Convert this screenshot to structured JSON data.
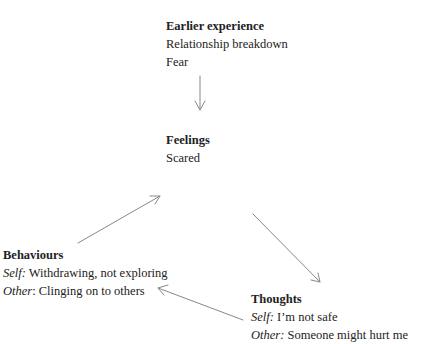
{
  "nodes": {
    "earlier": {
      "title": "Earlier experience",
      "lines": [
        "Relationship breakdown",
        "Fear"
      ]
    },
    "feelings": {
      "title": "Feelings",
      "lines": [
        "Scared"
      ]
    },
    "behaviours": {
      "title": "Behaviours",
      "self_label": "Self:",
      "self_text": " Withdrawing, not exploring",
      "other_label": "Other",
      "other_text": ": Clinging on to others"
    },
    "thoughts": {
      "title": "Thoughts",
      "self_label": "Self:",
      "self_text": " I’m not safe",
      "other_label": "Other:",
      "other_text": " Someone might hurt me"
    }
  },
  "arrows": [
    {
      "from": "earlier",
      "to": "feelings"
    },
    {
      "from": "behaviours",
      "to": "feelings"
    },
    {
      "from": "feelings",
      "to": "thoughts"
    },
    {
      "from": "thoughts",
      "to": "behaviours"
    }
  ],
  "colors": {
    "text": "#222222",
    "arrow": "#888888"
  }
}
